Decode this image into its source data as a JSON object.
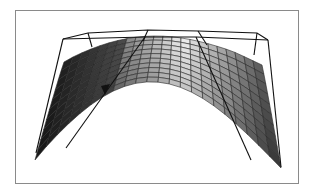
{
  "figure": {
    "type": "3d-surface-plot",
    "frame": {
      "x": 15,
      "y": 10,
      "width": 283,
      "height": 173,
      "stroke": "#8a8a8a"
    },
    "colors": {
      "background": "#ffffff",
      "surface_dark": "#1e1e1e",
      "surface_mid": "#6a6a6a",
      "surface_light": "#f2f2f2",
      "mesh": "#222222",
      "box": "#111111"
    },
    "mesh": {
      "rows": 10,
      "cols": 22
    }
  }
}
